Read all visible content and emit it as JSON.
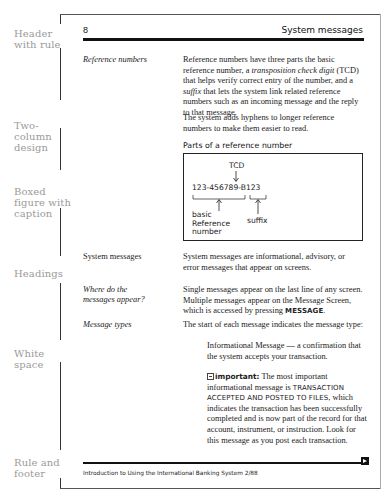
{
  "annotations": [
    {
      "label": "Header with rule"
    },
    {
      "label": "Two-column design"
    },
    {
      "label": "Boxed figure with caption"
    },
    {
      "label": "Headings"
    },
    {
      "label": "White space"
    },
    {
      "label": "Rule and footer"
    }
  ],
  "header": {
    "page_number": "8",
    "section_title": "System messages"
  },
  "sections": {
    "reference_numbers": {
      "heading": "Reference numbers",
      "para1": {
        "t1": "Reference numbers have three parts the basic reference number, a ",
        "i1": "transposition check digit",
        "t2": " (TCD) that helps verify correct entry of the number, and a ",
        "i2": "suffix",
        "t3": " that lets the system link related reference numbers such as an incoming message and the reply to that message."
      },
      "para2": "The system adds hyphens to longer reference numbers to make them easier to read."
    },
    "figure": {
      "caption": "Parts of a reference number",
      "tcd_label": "TCD",
      "number": "123-456789-B123",
      "basic_label_line1": "basic",
      "basic_label_line2": "Reference",
      "basic_label_line3": "number",
      "suffix_label": "suffix"
    },
    "system_messages": {
      "heading": "System messages",
      "text": "System messages are informational, advisory, or error messages that appear on screens."
    },
    "where_appear": {
      "heading_line1": "Where do the",
      "heading_line2": "messages appear?",
      "t1": "Single messages appear on the last line of any screen. Multiple messages appear on the Message Screen, which is accessed by pressing ",
      "key": "MESSAGE",
      "t2": "."
    },
    "message_types": {
      "heading": "Message types",
      "text": "The start of each message indicates the message type:",
      "informational": "Informational Message — a confirmation that the system accepts your transaction.",
      "important_label": "important:",
      "important_t1": " The most important informational message is ",
      "important_caps": "TRANSACTION ACCEPTED AND POSTED TO FILES",
      "important_t2": ", which indicates the transaction has been successfully completed and is now part of the record for that account, instrument, or instruction. Look for this message as you post each transaction."
    }
  },
  "footer": {
    "text": "Introduction to Using the International Banking System 2/88",
    "next_icon": "next-page-arrow-icon"
  }
}
